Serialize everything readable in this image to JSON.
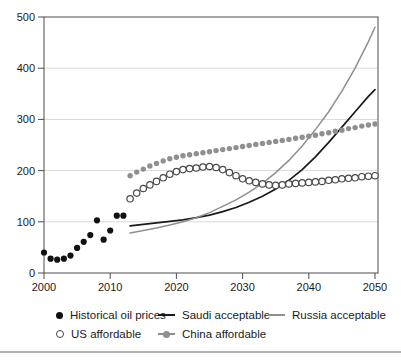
{
  "colors": {
    "background": "#ffffff",
    "axis": "#4d4d4d",
    "gridline": "#d9d9d9",
    "black_series": "#111111",
    "gray_series": "#8f8f8f",
    "divider": "#b3b3b3"
  },
  "chart_data": {
    "type": "line+scatter",
    "title": "",
    "xlabel": "",
    "ylabel": "",
    "xlim": [
      2000,
      2051
    ],
    "ylim": [
      0,
      500
    ],
    "x_ticks": [
      2000,
      2010,
      2020,
      2030,
      2040,
      2050
    ],
    "y_ticks": [
      0,
      100,
      200,
      300,
      400,
      500
    ],
    "gridlines": {
      "y": [
        100,
        200,
        300,
        400
      ],
      "color": "#d9d9d9"
    },
    "legend_position": "bottom",
    "series": [
      {
        "id": "saudi-acceptable-line",
        "name": "Saudi acceptable",
        "style": "line",
        "color": "#1a1a1a",
        "width": 1.7,
        "points": [
          [
            2013,
            92
          ],
          [
            2015,
            95
          ],
          [
            2017,
            98
          ],
          [
            2019,
            101
          ],
          [
            2021,
            104
          ],
          [
            2023,
            108
          ],
          [
            2025,
            113
          ],
          [
            2027,
            120
          ],
          [
            2029,
            128
          ],
          [
            2031,
            138
          ],
          [
            2033,
            150
          ],
          [
            2035,
            164
          ],
          [
            2037,
            181
          ],
          [
            2039,
            202
          ],
          [
            2041,
            227
          ],
          [
            2043,
            255
          ],
          [
            2045,
            285
          ],
          [
            2047,
            315
          ],
          [
            2049,
            345
          ],
          [
            2050,
            358
          ]
        ]
      },
      {
        "id": "russia-acceptable-line",
        "name": "Russia acceptable",
        "style": "line",
        "color": "#8f8f8f",
        "width": 1.5,
        "points": [
          [
            2013,
            78
          ],
          [
            2015,
            83
          ],
          [
            2017,
            88
          ],
          [
            2019,
            94
          ],
          [
            2021,
            100
          ],
          [
            2023,
            108
          ],
          [
            2025,
            118
          ],
          [
            2027,
            130
          ],
          [
            2029,
            143
          ],
          [
            2031,
            158
          ],
          [
            2033,
            175
          ],
          [
            2035,
            196
          ],
          [
            2037,
            220
          ],
          [
            2039,
            248
          ],
          [
            2041,
            280
          ],
          [
            2043,
            315
          ],
          [
            2045,
            355
          ],
          [
            2047,
            400
          ],
          [
            2049,
            452
          ],
          [
            2050,
            480
          ]
        ]
      },
      {
        "id": "us-affordable-dots",
        "name": "US affordable",
        "style": "scatter-open",
        "color": "#4a4a4a",
        "r": 3.2,
        "start_year": 2013,
        "values": [
          145,
          156,
          165,
          172,
          179,
          186,
          193,
          198,
          202,
          204,
          205,
          207,
          208,
          206,
          202,
          196,
          190,
          184,
          180,
          177,
          174,
          172,
          171,
          172,
          174,
          175,
          176,
          177,
          178,
          179,
          181,
          182,
          184,
          185,
          186,
          188,
          189,
          190
        ]
      },
      {
        "id": "china-affordable-dots",
        "name": "China affordable",
        "style": "scatter-filled",
        "color": "#8f8f8f",
        "r": 2.7,
        "start_year": 2013,
        "values": [
          190,
          197,
          203,
          209,
          214,
          219,
          223,
          226,
          229,
          231,
          233,
          235,
          237,
          239,
          241,
          243,
          245,
          247,
          249,
          251,
          253,
          255,
          257,
          259,
          261,
          263,
          265,
          267,
          269,
          272,
          274,
          277,
          279,
          282,
          284,
          287,
          289,
          291
        ]
      },
      {
        "id": "historical-oil-prices-dots",
        "name": "Historical oil prices",
        "style": "scatter-filled",
        "color": "#111111",
        "r": 3.1,
        "start_year": 2000,
        "values": [
          40,
          28,
          26,
          28,
          34,
          49,
          61,
          74,
          103,
          65,
          83,
          112,
          112
        ]
      }
    ]
  },
  "legend": {
    "rows": [
      [
        {
          "icon": "filled-dot",
          "label": "Historical oil prices"
        },
        {
          "icon": "black-line",
          "label": "Saudi acceptable"
        },
        {
          "icon": "gray-line",
          "label": "Russia acceptable"
        }
      ],
      [
        {
          "icon": "open-circle",
          "label": "US affordable"
        },
        {
          "icon": "gray-line-dot",
          "label": "China affordable"
        }
      ]
    ]
  }
}
